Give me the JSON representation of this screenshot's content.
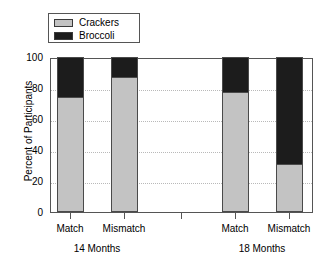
{
  "chart_data": {
    "type": "bar",
    "subtype": "stacked-bar-100-percent",
    "title": "",
    "xlabel": "",
    "ylabel": "Percent of Participants",
    "ylim": [
      0,
      100
    ],
    "yticks": [
      0,
      20,
      40,
      60,
      80,
      100
    ],
    "ytick_labels": [
      "0",
      "20",
      "40",
      "60",
      "80",
      "100"
    ],
    "grid": "horizontal-dotted",
    "legend_position": "top-left-outside",
    "categories": [
      "Match",
      "Mismatch",
      "Match",
      "Mismatch"
    ],
    "groups": [
      {
        "label": "14 Months",
        "categories": [
          "Match",
          "Mismatch"
        ]
      },
      {
        "label": "18 Months",
        "categories": [
          "Match",
          "Mismatch"
        ]
      }
    ],
    "series": [
      {
        "name": "Crackers",
        "color": "#c3c3c3",
        "values": [
          74,
          87,
          77,
          30
        ]
      },
      {
        "name": "Broccoli",
        "color": "#1c1c1c",
        "values": [
          26,
          13,
          23,
          70
        ]
      }
    ],
    "bars": [
      {
        "group": "14 Months",
        "category": "Match",
        "crackers": 74,
        "broccoli": 26
      },
      {
        "group": "14 Months",
        "category": "Mismatch",
        "crackers": 87,
        "broccoli": 13
      },
      {
        "group": "18 Months",
        "category": "Match",
        "crackers": 77,
        "broccoli": 23
      },
      {
        "group": "18 Months",
        "category": "Mismatch",
        "crackers": 30,
        "broccoli": 70
      }
    ]
  },
  "legend": {
    "items": [
      {
        "label": "Crackers",
        "color": "#c3c3c3"
      },
      {
        "label": "Broccoli",
        "color": "#1c1c1c"
      }
    ]
  },
  "axes": {
    "y_title": "Percent of Participants",
    "y_ticks": [
      "100",
      "80",
      "60",
      "40",
      "20",
      "0"
    ],
    "x_ticks": [
      "Match",
      "Mismatch",
      "Match",
      "Mismatch"
    ],
    "x_groups": [
      "14 Months",
      "18 Months"
    ]
  },
  "colors": {
    "crackers": "#c3c3c3",
    "broccoli": "#1c1c1c",
    "axis": "#555555",
    "grid": "#b9b9b9",
    "background": "#ffffff"
  }
}
